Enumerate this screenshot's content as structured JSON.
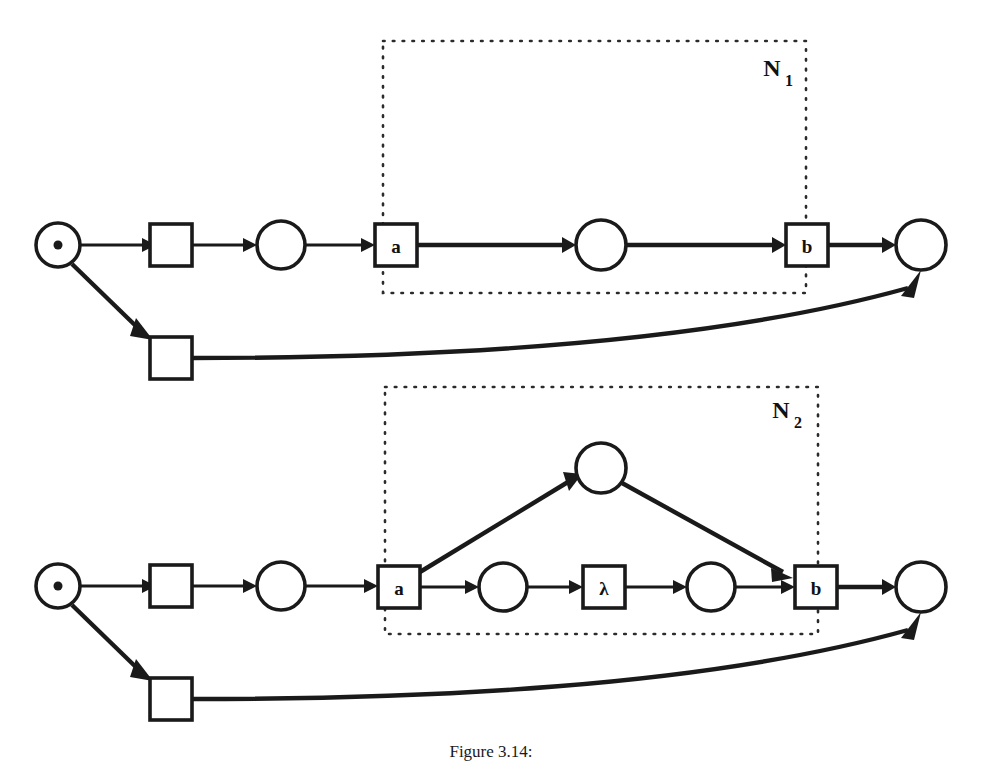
{
  "figure": {
    "caption": "Figure 3.14:",
    "caption_top": 742,
    "background": "#ffffff",
    "ink_color": "#1a1a1a"
  },
  "nets": [
    {
      "id": "net-1",
      "name": "N",
      "subscript": "1",
      "name_x": 772,
      "name_y": 68,
      "subnet_box": {
        "x": 383,
        "y": 41,
        "width": 423,
        "height": 252
      },
      "places": [
        {
          "id": "p-start-1",
          "cx": 58,
          "cy": 245,
          "r": 22,
          "token": true
        },
        {
          "id": "p-mid-1",
          "cx": 281,
          "cy": 245,
          "r": 24,
          "token": false
        },
        {
          "id": "p-inner-1",
          "cx": 601,
          "cy": 245,
          "r": 25,
          "token": false
        },
        {
          "id": "p-end-1",
          "cx": 921,
          "cy": 245,
          "r": 25,
          "token": false
        }
      ],
      "transitions": [
        {
          "id": "t-silent-top-1",
          "x": 150,
          "y": 224,
          "w": 42,
          "h": 42,
          "label": ""
        },
        {
          "id": "t-silent-bot-1",
          "x": 150,
          "y": 337,
          "w": 42,
          "h": 42,
          "label": ""
        },
        {
          "id": "t-a-1",
          "x": 375,
          "y": 224,
          "w": 42,
          "h": 42,
          "label": "a"
        },
        {
          "id": "t-b-1",
          "x": 786,
          "y": 224,
          "w": 42,
          "h": 42,
          "label": "b"
        }
      ]
    },
    {
      "id": "net-2",
      "name": "N",
      "subscript": "2",
      "name_x": 781,
      "name_y": 410,
      "subnet_box": {
        "x": 385,
        "y": 387,
        "width": 433,
        "height": 247
      },
      "places": [
        {
          "id": "p-start-2",
          "cx": 58,
          "cy": 586,
          "r": 22,
          "token": true
        },
        {
          "id": "p-mid-2",
          "cx": 281,
          "cy": 586,
          "r": 24,
          "token": false
        },
        {
          "id": "p-upper-2",
          "cx": 601,
          "cy": 468,
          "r": 25,
          "token": false
        },
        {
          "id": "p-low-a-2",
          "cx": 503,
          "cy": 587,
          "r": 24,
          "token": false
        },
        {
          "id": "p-low-b-2",
          "cx": 711,
          "cy": 587,
          "r": 24,
          "token": false
        },
        {
          "id": "p-end-2",
          "cx": 921,
          "cy": 587,
          "r": 25,
          "token": false
        }
      ],
      "transitions": [
        {
          "id": "t-silent-top-2",
          "x": 150,
          "y": 565,
          "w": 42,
          "h": 42,
          "label": ""
        },
        {
          "id": "t-silent-bot-2",
          "x": 150,
          "y": 678,
          "w": 42,
          "h": 42,
          "label": ""
        },
        {
          "id": "t-a-2",
          "x": 378,
          "y": 566,
          "w": 42,
          "h": 42,
          "label": "a"
        },
        {
          "id": "t-lambda-2",
          "x": 583,
          "y": 566,
          "w": 42,
          "h": 42,
          "label": "λ"
        },
        {
          "id": "t-b-2",
          "x": 795,
          "y": 566,
          "w": 42,
          "h": 42,
          "label": "b"
        }
      ]
    }
  ],
  "arc_labels": {
    "straight": "straight-arc",
    "curved": "feedback-arc",
    "diagonal": "branch-arc"
  }
}
